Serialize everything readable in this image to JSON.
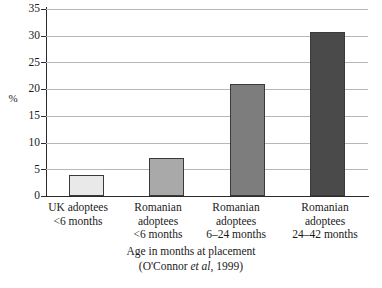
{
  "chart_data": {
    "type": "bar",
    "title": "",
    "xlabel": "Age in months at placement",
    "ylabel": "%",
    "ylim": [
      0,
      35
    ],
    "ytick_step": 5,
    "yticks": [
      35,
      30,
      25,
      20,
      15,
      10,
      5,
      0
    ],
    "grid": true,
    "legend": "none",
    "categories": [
      "UK adoptees\n<6 months",
      "Romanian adoptees\n<6 months",
      "Romanian adoptees\n6–24 months",
      "Romanian adoptees\n24–42 months"
    ],
    "category_lines": [
      [
        "UK adoptees",
        "<6 months"
      ],
      [
        "Romanian",
        "adoptees",
        "<6 months"
      ],
      [
        "Romanian",
        "adoptees",
        "6–24 months"
      ],
      [
        "Romanian",
        "adoptees",
        "24–42 months"
      ]
    ],
    "values": [
      4,
      7.2,
      21,
      30.7
    ],
    "bar_colors": [
      "#e9e9e9",
      "#a9a9a9",
      "#7d7d7d",
      "#4a4a4a"
    ],
    "bar_border_color": "#3a3a3a",
    "source": "(O'Connor et al, 1999)",
    "source_prefix": "(O'Connor ",
    "source_italic": "et al",
    "source_suffix": ", 1999)"
  },
  "axis": {
    "y_title": "%",
    "x_title": "Age in months at placement",
    "tick_35": "35",
    "tick_30": "30",
    "tick_25": "25",
    "tick_20": "20",
    "tick_15": "15",
    "tick_10": "10",
    "tick_5": "5",
    "tick_0": "0"
  },
  "cat0": {
    "l0": "UK adoptees",
    "l1": "<6 months"
  },
  "cat1": {
    "l0": "Romanian",
    "l1": "adoptees",
    "l2": "<6 months"
  },
  "cat2": {
    "l0": "Romanian",
    "l1": "adoptees",
    "l2": "6–24 months"
  },
  "cat3": {
    "l0": "Romanian",
    "l1": "adoptees",
    "l2": "24–42 months"
  }
}
